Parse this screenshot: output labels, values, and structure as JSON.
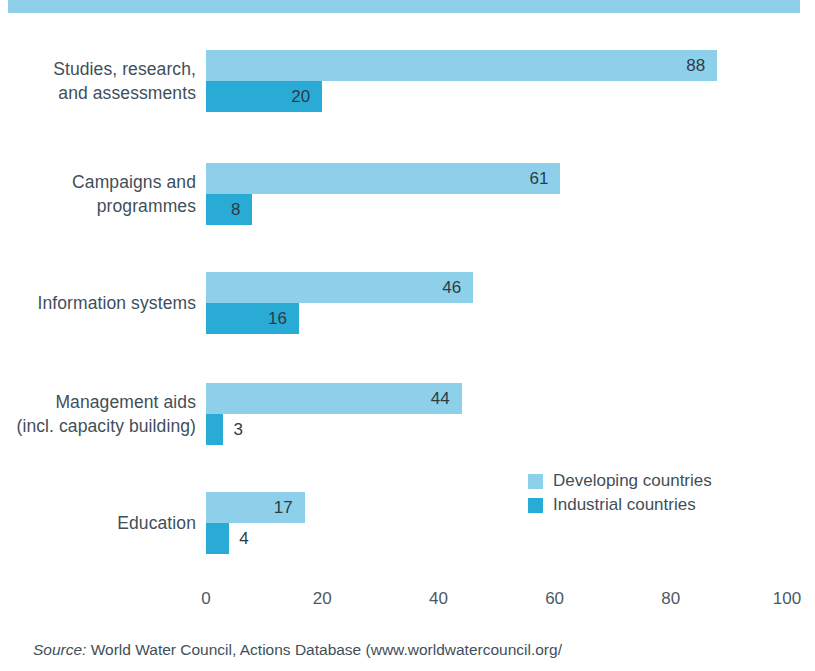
{
  "chart_data": {
    "type": "bar",
    "orientation": "horizontal",
    "title": "",
    "xlabel": "",
    "ylabel": "",
    "xlim": [
      0,
      100
    ],
    "grid": false,
    "legend_position": "inside-right",
    "categories": [
      "Studies, research,\nand assessments",
      "Campaigns and\nprogrammes",
      "Information systems",
      "Management aids\n(incl. capacity building)",
      "Education"
    ],
    "series": [
      {
        "name": "Developing countries",
        "color": "#8ed0ea",
        "values": [
          88,
          61,
          46,
          44,
          17
        ]
      },
      {
        "name": "Industrial countries",
        "color": "#29abd6",
        "values": [
          20,
          8,
          16,
          3,
          4
        ]
      }
    ],
    "tick_labels": [
      "0",
      "20",
      "40",
      "60",
      "80",
      "100"
    ],
    "tick_values": [
      0,
      20,
      40,
      60,
      80,
      100
    ]
  },
  "groups": [
    {
      "label_line1": "Studies, research,",
      "label_line2": "and assessments",
      "developing": {
        "value": 88,
        "label": "88",
        "label_inside": true
      },
      "industrial": {
        "value": 20,
        "label": "20",
        "label_inside": true
      }
    },
    {
      "label_line1": "Campaigns and",
      "label_line2": "programmes",
      "developing": {
        "value": 61,
        "label": "61",
        "label_inside": true
      },
      "industrial": {
        "value": 8,
        "label": "8",
        "label_inside": true
      }
    },
    {
      "label_line1": "Information systems",
      "label_line2": "",
      "developing": {
        "value": 46,
        "label": "46",
        "label_inside": true
      },
      "industrial": {
        "value": 16,
        "label": "16",
        "label_inside": true
      }
    },
    {
      "label_line1": "Management aids",
      "label_line2": "(incl. capacity building)",
      "developing": {
        "value": 44,
        "label": "44",
        "label_inside": true
      },
      "industrial": {
        "value": 3,
        "label": "3",
        "label_inside": false
      }
    },
    {
      "label_line1": "Education",
      "label_line2": "",
      "developing": {
        "value": 17,
        "label": "17",
        "label_inside": true
      },
      "industrial": {
        "value": 4,
        "label": "4",
        "label_inside": false
      }
    }
  ],
  "legend": {
    "items": [
      {
        "label": "Developing countries",
        "color": "#8ed0ea"
      },
      {
        "label": "Industrial countries",
        "color": "#29abd6"
      }
    ]
  },
  "axis": {
    "ticks": [
      {
        "label": "0",
        "value": 0
      },
      {
        "label": "20",
        "value": 20
      },
      {
        "label": "40",
        "value": 40
      },
      {
        "label": "60",
        "value": 60
      },
      {
        "label": "80",
        "value": 80
      },
      {
        "label": "100",
        "value": 100
      }
    ]
  },
  "source": {
    "prefix": "Source:",
    "text": " World Water Council, Actions Database (www.worldwatercouncil.org/"
  },
  "colors": {
    "developing": "#8ed0ea",
    "industrial": "#29abd6",
    "band": "#8ed0ea",
    "text": "#3f4f5a"
  }
}
